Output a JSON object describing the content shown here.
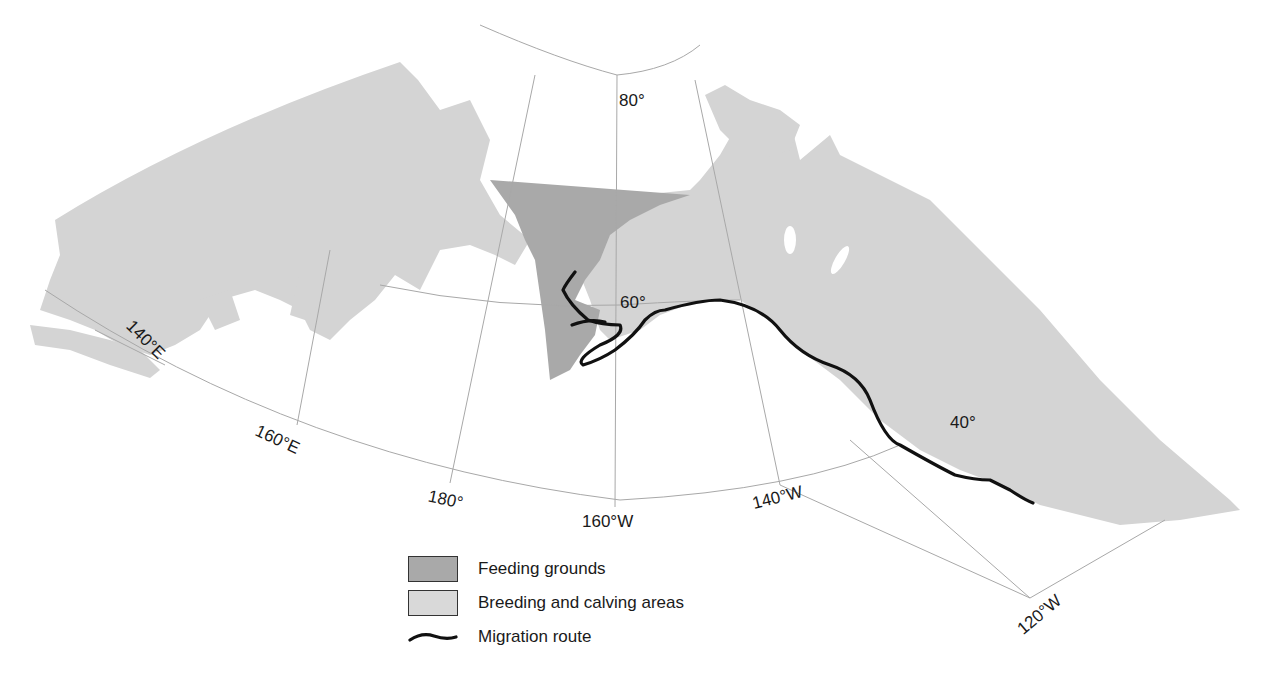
{
  "map": {
    "colors": {
      "feeding_grounds": "#a9a9a9",
      "breeding_calving": "#d4d4d4",
      "migration_route": "#111111",
      "graticule": "#a8a8a8"
    },
    "latitude_labels": [
      {
        "text": "80°"
      },
      {
        "text": "60°"
      },
      {
        "text": "40°"
      }
    ],
    "longitude_labels": [
      {
        "text": "140°E"
      },
      {
        "text": "160°E"
      },
      {
        "text": "180°"
      },
      {
        "text": "160°W"
      },
      {
        "text": "140°W"
      },
      {
        "text": "120°W"
      }
    ]
  },
  "legend": {
    "items": [
      {
        "label": "Feeding grounds",
        "type": "fill",
        "color": "#a9a9a9"
      },
      {
        "label": "Breeding and calving areas",
        "type": "fill",
        "color": "#d4d4d4"
      },
      {
        "label": "Migration route",
        "type": "line",
        "color": "#111111"
      }
    ]
  }
}
